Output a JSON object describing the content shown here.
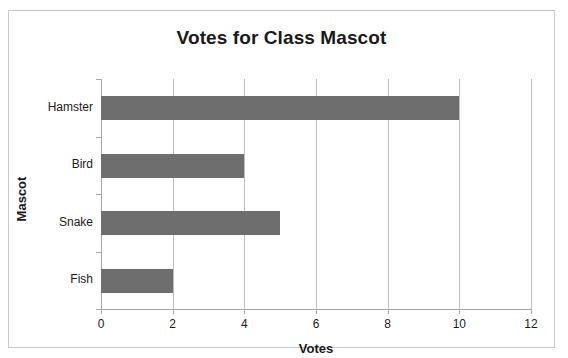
{
  "chart_data": {
    "type": "bar",
    "orientation": "horizontal",
    "title": "Votes for Class Mascot",
    "xlabel": "Votes",
    "ylabel": "Mascot",
    "categories": [
      "Hamster",
      "Bird",
      "Snake",
      "Fish"
    ],
    "values": [
      10,
      4,
      5,
      2
    ],
    "xlim": [
      0,
      12
    ],
    "xticks": [
      0,
      2,
      4,
      6,
      8,
      10,
      12
    ],
    "xtick_labels": [
      "0",
      "2",
      "4",
      "6",
      "8",
      "10",
      "12"
    ],
    "grid": "vertical",
    "legend": "none",
    "bar_color": "#6e6e6e",
    "gridline_color": "#bdbdbd",
    "axis_color": "#a6a6a6",
    "text_color": "#1a1a1a",
    "background": "#ffffff"
  }
}
